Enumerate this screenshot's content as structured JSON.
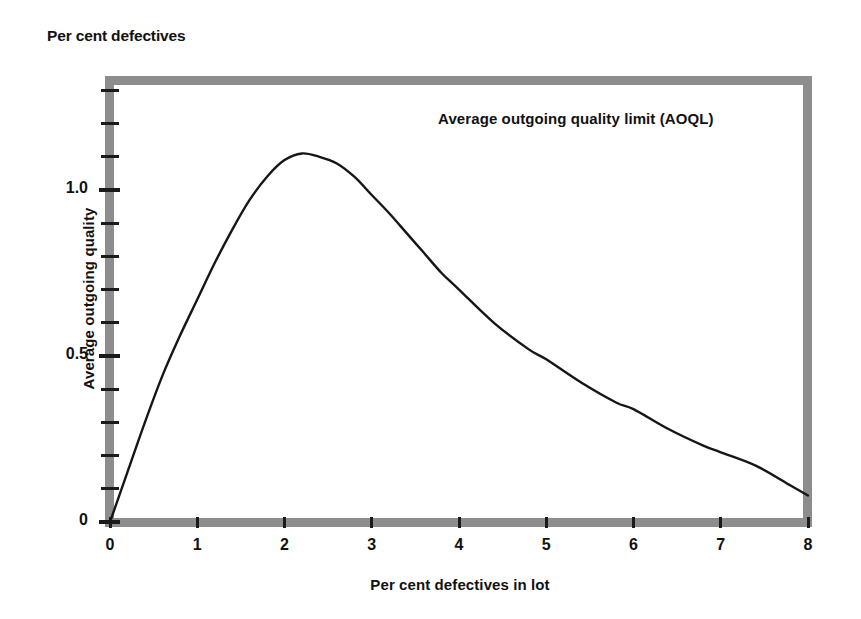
{
  "figure": {
    "corner_caption": "Per cent\ndefectives",
    "background_color": "#ffffff",
    "frame_color": "#8d8d8d",
    "curve_color": "#161616"
  },
  "chart_data": {
    "type": "line",
    "title": "",
    "annotation": "Average outgoing quality limit (AOQL)",
    "xlabel": "Per cent defectives in lot",
    "ylabel": "Average outgoing quality",
    "corner_label": "Per cent defectives",
    "xlim": [
      0,
      8
    ],
    "ylim": [
      0,
      1.35
    ],
    "grid": false,
    "legend": "none",
    "xticks": [
      0,
      1,
      2,
      3,
      4,
      5,
      6,
      7,
      8
    ],
    "xticklabels": [
      "0",
      "1",
      "2",
      "3",
      "4",
      "5",
      "6",
      "7",
      "8"
    ],
    "yticks_major": [
      0,
      0.5,
      1.0
    ],
    "yticklabels": [
      "0",
      "0.5",
      "1.0"
    ],
    "yticks_minor": [
      0.1,
      0.2,
      0.3,
      0.4,
      0.6,
      0.7,
      0.8,
      0.9,
      1.1,
      1.2,
      1.3
    ],
    "aoql_value": 1.11,
    "aoql_at_x": 2.2,
    "series": [
      {
        "name": "Average outgoing quality",
        "x": [
          0,
          0.2,
          0.4,
          0.6,
          0.8,
          1.0,
          1.2,
          1.4,
          1.6,
          1.8,
          2.0,
          2.2,
          2.4,
          2.6,
          2.8,
          3.0,
          3.2,
          3.4,
          3.6,
          3.8,
          4.0,
          4.4,
          4.8,
          5.0,
          5.4,
          5.8,
          6.0,
          6.4,
          6.8,
          7.0,
          7.4,
          7.8,
          8.0
        ],
        "y": [
          0,
          0.15,
          0.3,
          0.44,
          0.56,
          0.67,
          0.78,
          0.88,
          0.97,
          1.04,
          1.09,
          1.11,
          1.1,
          1.08,
          1.04,
          0.985,
          0.93,
          0.87,
          0.81,
          0.75,
          0.7,
          0.6,
          0.52,
          0.49,
          0.42,
          0.36,
          0.34,
          0.28,
          0.23,
          0.21,
          0.17,
          0.11,
          0.08
        ]
      }
    ]
  }
}
